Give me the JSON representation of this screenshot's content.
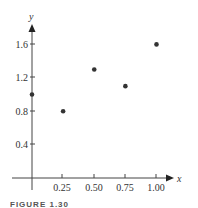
{
  "chart_data": {
    "type": "scatter",
    "title": "",
    "xlabel": "x",
    "ylabel": "y",
    "x": [
      0,
      0.25,
      0.5,
      0.75,
      1.0
    ],
    "y": [
      1.0,
      0.8,
      1.3,
      1.1,
      1.6
    ],
    "xticks": [
      "0.25",
      "0.50",
      "0.75",
      "1.00"
    ],
    "yticks": [
      "0.4",
      "0.8",
      "1.2",
      "1.6"
    ],
    "xlim": [
      0,
      1.1
    ],
    "ylim": [
      0,
      1.8
    ],
    "grid": false,
    "legend": null,
    "marker_color": "#333333"
  },
  "caption": "FIGURE 1.30"
}
